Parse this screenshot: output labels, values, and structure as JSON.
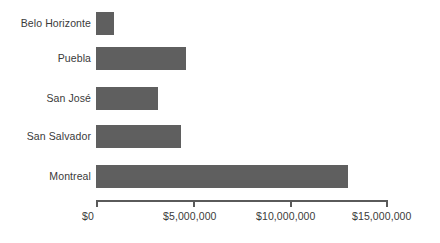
{
  "chart_data": {
    "type": "bar",
    "orientation": "horizontal",
    "title": "",
    "subtitle": "",
    "xlabel": "",
    "ylabel": "",
    "categories": [
      "Belo Horizonte",
      "Puebla",
      "San José",
      "San Salvador",
      "Montreal"
    ],
    "values": [
      925000,
      4620000,
      3185000,
      4370000,
      12945000
    ],
    "xlim": [
      0,
      15000000
    ],
    "x_ticks": [
      0,
      5000000,
      10000000,
      15000000
    ],
    "x_tick_labels": [
      "$0",
      "$5,000,000",
      "$10,000,000",
      "$15,000,000"
    ],
    "grid": false,
    "legend": false,
    "legend_position": "none",
    "bar_color": "#5f5f5f",
    "axis_color": "#5a5a5a",
    "text_color": "#3a3a3a",
    "background_color": "#ffffff"
  },
  "axis": {
    "x_labels": [
      {
        "text": "$0"
      },
      {
        "text": "$5,000,000"
      },
      {
        "text": "$10,000,000"
      },
      {
        "text": "$15,000,000"
      }
    ]
  },
  "categories": [
    {
      "label": "Belo Horizonte"
    },
    {
      "label": "Puebla"
    },
    {
      "label": "San José"
    },
    {
      "label": "San Salvador"
    },
    {
      "label": "Montreal"
    }
  ]
}
